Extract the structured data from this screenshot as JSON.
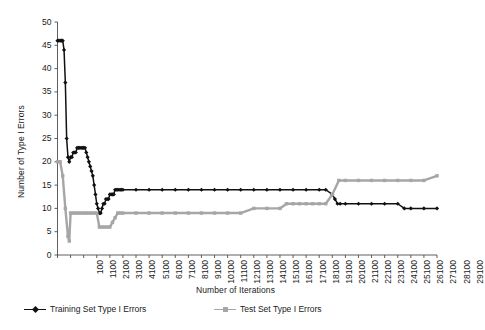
{
  "chart_data": {
    "type": "line",
    "title": "",
    "xlabel": "Number of Iterations",
    "ylabel": "Number of Type I Errors",
    "xlim": [
      100,
      29100
    ],
    "ylim": [
      0,
      50
    ],
    "yticks": [
      0,
      5,
      10,
      15,
      20,
      25,
      30,
      35,
      40,
      45,
      50
    ],
    "xticks": [
      100,
      1100,
      2100,
      3100,
      4100,
      5100,
      6100,
      7100,
      8100,
      9100,
      10100,
      11100,
      12100,
      13100,
      14100,
      15100,
      16100,
      17100,
      18100,
      19100,
      20100,
      21100,
      22100,
      23100,
      24100,
      25100,
      26100,
      27100,
      28100,
      29100
    ],
    "xtick_labels": [
      "100",
      "1100",
      "2100",
      "3100",
      "4100",
      "5100",
      "6100",
      "7100",
      "8100",
      "9100",
      "10100",
      "11100",
      "12100",
      "13100",
      "14100",
      "15100",
      "16100",
      "17100",
      "18100",
      "19100",
      "20100",
      "21100",
      "22100",
      "23100",
      "24100",
      "25100",
      "26100",
      "27100",
      "28100",
      "29100"
    ],
    "grid": false,
    "legend_position": "bottom",
    "series": [
      {
        "name": "Training Set Type I Errors",
        "color": "#111111",
        "marker": "diamond",
        "x": [
          100,
          200,
          300,
          400,
          500,
          600,
          700,
          800,
          900,
          1000,
          1100,
          1200,
          1300,
          1400,
          1500,
          1600,
          1700,
          1800,
          1900,
          2000,
          2100,
          2200,
          2300,
          2400,
          2500,
          2600,
          2700,
          2800,
          2900,
          3000,
          3100,
          3200,
          3300,
          3400,
          3500,
          3600,
          3700,
          3800,
          3900,
          4000,
          4100,
          4200,
          4300,
          4400,
          4500,
          4600,
          4700,
          4800,
          4900,
          5000,
          5100,
          6100,
          7100,
          8100,
          9100,
          10100,
          11100,
          12100,
          13100,
          14100,
          15100,
          16100,
          17100,
          18100,
          19100,
          20100,
          20600,
          21100,
          21300,
          21500,
          21700,
          22100,
          23100,
          24100,
          25100,
          26100,
          26600,
          27100,
          28100,
          29100
        ],
        "values": [
          46,
          46,
          46,
          46,
          46,
          44,
          37,
          25,
          21,
          20,
          21,
          21,
          22,
          22,
          22,
          23,
          23,
          23,
          23,
          23,
          23,
          23,
          22,
          21,
          20,
          19,
          18,
          17,
          15,
          13,
          11,
          10,
          9,
          9,
          10,
          11,
          11,
          12,
          12,
          12,
          13,
          13,
          13,
          13,
          14,
          14,
          14,
          14,
          14,
          14,
          14,
          14,
          14,
          14,
          14,
          14,
          14,
          14,
          14,
          14,
          14,
          14,
          14,
          14,
          14,
          14,
          14,
          13,
          12,
          11,
          11,
          11,
          11,
          11,
          11,
          11,
          10,
          10,
          10,
          10
        ]
      },
      {
        "name": "Test Set Type I Errors",
        "color": "#a6a6a6",
        "marker": "square",
        "x": [
          100,
          300,
          500,
          700,
          900,
          1000,
          1100,
          1300,
          1500,
          1700,
          1900,
          2100,
          2300,
          2500,
          2700,
          2900,
          3100,
          3300,
          3500,
          3700,
          3900,
          4100,
          4300,
          4500,
          4700,
          4900,
          5100,
          6100,
          7100,
          8100,
          9100,
          10100,
          11100,
          12100,
          13100,
          14100,
          15100,
          16100,
          17100,
          17600,
          18100,
          18600,
          19100,
          19600,
          20100,
          20600,
          21100,
          21600,
          22100,
          23100,
          24100,
          25100,
          26100,
          27100,
          28100,
          29100
        ],
        "values": [
          20,
          20,
          17,
          10,
          4,
          3,
          9,
          9,
          9,
          9,
          9,
          9,
          9,
          9,
          9,
          9,
          9,
          6,
          6,
          6,
          6,
          6,
          7,
          8,
          9,
          9,
          9,
          9,
          9,
          9,
          9,
          9,
          9,
          9,
          9,
          9,
          10,
          10,
          10,
          11,
          11,
          11,
          11,
          11,
          11,
          11,
          13,
          16,
          16,
          16,
          16,
          16,
          16,
          16,
          16,
          17
        ]
      }
    ]
  },
  "legend": {
    "training_label": "Training Set Type I Errors",
    "test_label": "Test Set Type I Errors"
  }
}
